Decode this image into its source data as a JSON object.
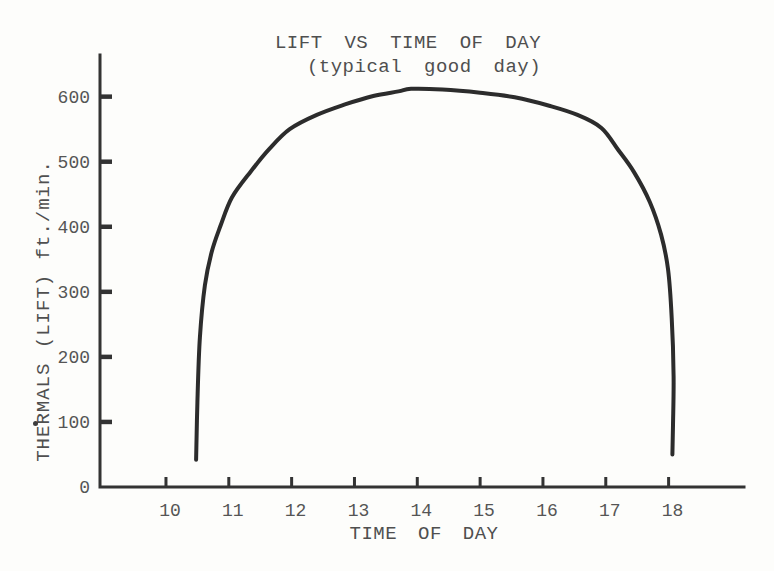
{
  "chart_data": {
    "type": "line",
    "title": "LIFT VS TIME OF DAY",
    "subtitle": "(typical good day)",
    "xlabel": "TIME OF DAY",
    "ylabel": "THERMALS (LIFT) ft./min.",
    "x_ticks": [
      10,
      11,
      12,
      13,
      14,
      15,
      16,
      17,
      18
    ],
    "y_ticks": [
      0,
      100,
      200,
      300,
      400,
      500,
      600
    ],
    "xlim": [
      8.95,
      19.2
    ],
    "ylim": [
      0,
      664
    ],
    "grid": false,
    "legend": "none",
    "series": [
      {
        "name": "thermal lift",
        "points": [
          [
            10.48,
            42
          ],
          [
            10.5,
            130
          ],
          [
            10.54,
            230
          ],
          [
            10.62,
            310
          ],
          [
            10.73,
            362
          ],
          [
            10.87,
            402
          ],
          [
            11.05,
            445
          ],
          [
            11.35,
            485
          ],
          [
            11.65,
            520
          ],
          [
            11.97,
            550
          ],
          [
            12.4,
            572
          ],
          [
            12.85,
            588
          ],
          [
            13.3,
            601
          ],
          [
            13.7,
            608
          ],
          [
            13.9,
            612
          ],
          [
            14.4,
            611
          ],
          [
            15.0,
            606
          ],
          [
            15.55,
            599
          ],
          [
            16.1,
            586
          ],
          [
            16.55,
            572
          ],
          [
            16.93,
            552
          ],
          [
            17.2,
            518
          ],
          [
            17.45,
            484
          ],
          [
            17.7,
            438
          ],
          [
            17.88,
            388
          ],
          [
            17.99,
            335
          ],
          [
            18.05,
            260
          ],
          [
            18.08,
            170
          ],
          [
            18.07,
            95
          ],
          [
            18.06,
            50
          ]
        ]
      }
    ],
    "colors": {
      "curve": "#2c2c2c",
      "axis": "#333333",
      "text": "#4f4f4f",
      "tick_label": "#555555",
      "background": "#fdfdfb"
    }
  }
}
